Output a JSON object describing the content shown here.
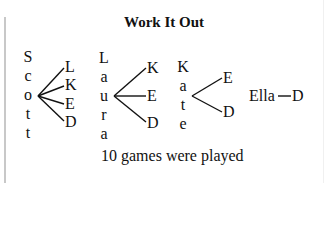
{
  "title": "Work It Out",
  "trees": [
    {
      "name": "Scott",
      "letters": [
        "S",
        "c",
        "o",
        "t",
        "t"
      ],
      "branches": [
        "L",
        "K",
        "E",
        "D"
      ]
    },
    {
      "name": "Laura",
      "letters": [
        "L",
        "a",
        "u",
        "r",
        "a"
      ],
      "branches": [
        "K",
        "E",
        "D"
      ]
    },
    {
      "name": "Kate",
      "letters": [
        "K",
        "a",
        "t",
        "e"
      ],
      "branches": [
        "E",
        "D"
      ]
    },
    {
      "name": "Ella",
      "letters": [
        "Ella"
      ],
      "branches": [
        "D"
      ]
    }
  ],
  "caption": "10 games were played"
}
